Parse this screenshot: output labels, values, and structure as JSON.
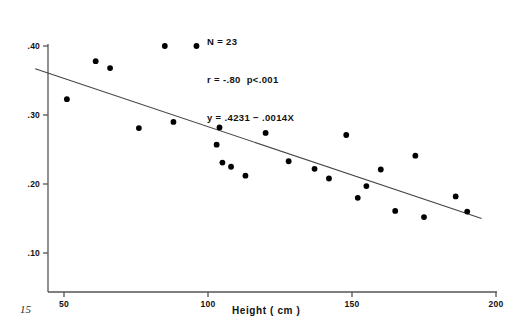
{
  "figure": {
    "folio": "15",
    "annotation": {
      "line1": "N = 23",
      "line2": "r = -.80  p<.001",
      "line3": "y = .4231 − .0014X"
    }
  },
  "chart_data": {
    "type": "scatter",
    "title": "",
    "xlabel": "Height ( cm )",
    "ylabel": "",
    "xlim": [
      40,
      200
    ],
    "ylim": [
      0.06,
      0.425
    ],
    "grid": false,
    "legend": null,
    "xticks": [
      50,
      100,
      150,
      200
    ],
    "xtick_labels": [
      "50",
      "100",
      "150",
      "200"
    ],
    "yticks": [
      0.1,
      0.2,
      0.3,
      0.4
    ],
    "ytick_labels": [
      ".10",
      ".20",
      ".30",
      ".40"
    ],
    "n": 23,
    "correlation": -0.8,
    "p_value": "<.001",
    "fit": {
      "type": "linear",
      "intercept": 0.4231,
      "slope": -0.0014,
      "equation": "y = .4231 − .0014X",
      "x_start": 40,
      "x_end": 195
    },
    "point_color": "#000000",
    "line_color": "#444444",
    "axis_color": "#555555",
    "points": [
      {
        "x": 51,
        "y": 0.323
      },
      {
        "x": 61,
        "y": 0.378
      },
      {
        "x": 66,
        "y": 0.368
      },
      {
        "x": 76,
        "y": 0.281
      },
      {
        "x": 85,
        "y": 0.4
      },
      {
        "x": 88,
        "y": 0.29
      },
      {
        "x": 96,
        "y": 0.4
      },
      {
        "x": 103,
        "y": 0.257
      },
      {
        "x": 104,
        "y": 0.282
      },
      {
        "x": 105,
        "y": 0.231
      },
      {
        "x": 108,
        "y": 0.225
      },
      {
        "x": 113,
        "y": 0.212
      },
      {
        "x": 120,
        "y": 0.274
      },
      {
        "x": 128,
        "y": 0.233
      },
      {
        "x": 137,
        "y": 0.222
      },
      {
        "x": 142,
        "y": 0.208
      },
      {
        "x": 148,
        "y": 0.271
      },
      {
        "x": 152,
        "y": 0.18
      },
      {
        "x": 155,
        "y": 0.197
      },
      {
        "x": 160,
        "y": 0.221
      },
      {
        "x": 165,
        "y": 0.161
      },
      {
        "x": 172,
        "y": 0.241
      },
      {
        "x": 175,
        "y": 0.152
      },
      {
        "x": 186,
        "y": 0.182
      },
      {
        "x": 190,
        "y": 0.16
      }
    ]
  }
}
